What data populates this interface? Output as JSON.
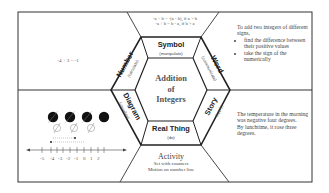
{
  "center": {
    "title_line1": "Addition",
    "title_line2": "of",
    "title_line3": "Integers"
  },
  "sections": {
    "symbol": {
      "label": "Symbol",
      "sub": "(manipulate)",
      "content_line1": "-a + b = -(a - b), if a > b",
      "content_line2": "-a + b = b - a, if b > a"
    },
    "word": {
      "label": "Word",
      "sub": "(communicate)",
      "intro": "To add two integers of different signs,",
      "bullets": [
        "find the difference between their positive values",
        "take the sign of the numerically"
      ]
    },
    "story": {
      "label": "Story",
      "sub": "(apply)",
      "line1": "The temperature in the morning was negative four degrees.",
      "line2": "By lunchtime, it rose three degrees."
    },
    "real_thing": {
      "label": "Real Thing",
      "sub": "(do)"
    },
    "diagram": {
      "label": "Diagram",
      "sub": "(visualize)",
      "number_line_ticks": [
        "-5",
        "-4",
        "-3",
        "-2",
        "-1",
        "0",
        "1",
        "2"
      ],
      "filled_counters": 4,
      "empty_counters": 3
    },
    "number": {
      "label": "Number",
      "sub": "(calculate)",
      "content": "-4 + 3 = -1"
    },
    "activity": {
      "title": "Activity",
      "line1": "Set with counters",
      "line2": "Motion on number line"
    }
  },
  "colors": {
    "line": "#222222",
    "frame": "#333333",
    "counter_fill": "#111111",
    "counter_empty": "#888888"
  }
}
